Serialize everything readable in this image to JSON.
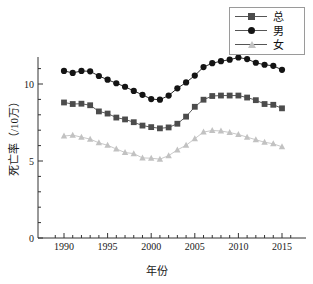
{
  "chart_data": {
    "type": "line",
    "title": "",
    "xlabel": "年份",
    "ylabel": "死亡率（/10万）",
    "x": [
      1990,
      1991,
      1992,
      1993,
      1994,
      1995,
      1996,
      1997,
      1998,
      1999,
      2000,
      2001,
      2002,
      2003,
      2004,
      2005,
      2006,
      2007,
      2008,
      2009,
      2010,
      2011,
      2012,
      2013,
      2014,
      2015
    ],
    "xlim": [
      1988.5,
      2016.5
    ],
    "ylim": [
      0,
      12.2
    ],
    "xticks": [
      1990,
      1995,
      2000,
      2005,
      2010,
      2015
    ],
    "xticklabels": [
      "1990",
      "1995",
      "2000",
      "2005",
      "2010",
      "2015"
    ],
    "yticks": [
      0,
      5,
      10
    ],
    "yticklabels": [
      "0",
      "5",
      "10"
    ],
    "yminorticks": [
      1,
      2,
      3,
      4,
      6,
      7,
      8,
      9,
      11,
      12
    ],
    "grid": false,
    "legend_position": "top-right",
    "series": [
      {
        "name": "总",
        "marker": "square",
        "color": "#4c4c4c",
        "values": [
          8.8,
          8.7,
          8.72,
          8.62,
          8.22,
          8.08,
          7.82,
          7.7,
          7.52,
          7.3,
          7.2,
          7.12,
          7.18,
          7.42,
          7.88,
          8.52,
          8.98,
          9.22,
          9.25,
          9.25,
          9.25,
          9.12,
          8.95,
          8.7,
          8.65,
          8.42
        ]
      },
      {
        "name": "男",
        "marker": "circle",
        "color": "#141414",
        "values": [
          10.85,
          10.72,
          10.85,
          10.82,
          10.52,
          10.28,
          10.05,
          9.82,
          9.55,
          9.3,
          9.02,
          8.98,
          9.25,
          9.72,
          10.1,
          10.55,
          11.1,
          11.35,
          11.48,
          11.58,
          11.72,
          11.62,
          11.38,
          11.25,
          11.18,
          10.92
        ]
      },
      {
        "name": "女",
        "marker": "triangle",
        "color": "#c2c2c2",
        "values": [
          6.62,
          6.68,
          6.55,
          6.42,
          6.18,
          6.02,
          5.78,
          5.55,
          5.48,
          5.2,
          5.18,
          5.12,
          5.35,
          5.72,
          6.02,
          6.45,
          6.88,
          6.98,
          6.95,
          6.85,
          6.72,
          6.55,
          6.38,
          6.22,
          6.12,
          5.92
        ]
      }
    ]
  },
  "legend": {
    "items": [
      {
        "label": "总",
        "marker": "square"
      },
      {
        "label": "男",
        "marker": "circle"
      },
      {
        "label": "女",
        "marker": "triangle"
      }
    ]
  }
}
